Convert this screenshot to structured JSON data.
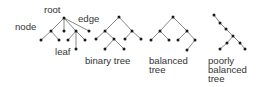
{
  "colors": {
    "background": "#ffffff",
    "edge": "#6a6a6a",
    "node": "#1a1a1a",
    "text": "#333333"
  },
  "annotations": {
    "root": "root",
    "edge": "edge",
    "node": "node",
    "leaf": "leaf"
  },
  "trees": [
    {
      "id": "general-tree",
      "caption": [],
      "nodes": [
        [
          64,
          18
        ],
        [
          51,
          31
        ],
        [
          64,
          31
        ],
        [
          76,
          31
        ],
        [
          89,
          31
        ],
        [
          41,
          40
        ],
        [
          59,
          40
        ],
        [
          68,
          40
        ],
        [
          76,
          49
        ],
        [
          85,
          40
        ]
      ],
      "edges": [
        [
          0,
          1
        ],
        [
          0,
          2
        ],
        [
          0,
          3
        ],
        [
          0,
          4
        ],
        [
          1,
          5
        ],
        [
          1,
          6
        ],
        [
          3,
          7
        ],
        [
          3,
          8
        ],
        [
          3,
          9
        ]
      ]
    },
    {
      "id": "binary-tree",
      "caption": [
        "binary tree"
      ],
      "nodes": [
        [
          119,
          17
        ],
        [
          105,
          31
        ],
        [
          132,
          31
        ],
        [
          96,
          39
        ],
        [
          114,
          39
        ],
        [
          125,
          39
        ],
        [
          141,
          39
        ],
        [
          105,
          49
        ],
        [
          124,
          49
        ]
      ],
      "edges": [
        [
          0,
          1
        ],
        [
          0,
          2
        ],
        [
          1,
          3
        ],
        [
          1,
          4
        ],
        [
          2,
          5
        ],
        [
          2,
          6
        ],
        [
          4,
          7
        ],
        [
          4,
          8
        ]
      ]
    },
    {
      "id": "balanced-tree",
      "caption": [
        "balanced",
        "tree"
      ],
      "nodes": [
        [
          173,
          17
        ],
        [
          160,
          31
        ],
        [
          187,
          31
        ],
        [
          151,
          40
        ],
        [
          169,
          40
        ],
        [
          178,
          40
        ],
        [
          195,
          40
        ],
        [
          187,
          50
        ]
      ],
      "edges": [
        [
          0,
          1
        ],
        [
          0,
          2
        ],
        [
          1,
          3
        ],
        [
          1,
          4
        ],
        [
          2,
          5
        ],
        [
          2,
          6
        ],
        [
          6,
          7
        ]
      ]
    },
    {
      "id": "poorly-balanced-tree",
      "caption": [
        "poorly",
        "balanced",
        "tree"
      ],
      "nodes": [
        [
          214,
          15
        ],
        [
          220,
          23
        ],
        [
          226,
          29
        ],
        [
          233,
          36
        ],
        [
          240,
          43
        ],
        [
          245,
          49
        ],
        [
          227,
          43
        ],
        [
          220,
          49
        ]
      ],
      "edges": [
        [
          0,
          1
        ],
        [
          1,
          2
        ],
        [
          2,
          3
        ],
        [
          3,
          4
        ],
        [
          4,
          5
        ],
        [
          3,
          6
        ],
        [
          6,
          7
        ]
      ]
    }
  ]
}
